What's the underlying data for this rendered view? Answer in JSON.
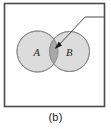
{
  "figure": {
    "caption": "(b)",
    "type": "venn-diagram",
    "panel_label": "(b)"
  },
  "frame": {
    "name": "outer-box",
    "x": 4.5,
    "y": 3.5,
    "width": 100,
    "height": 103,
    "stroke_color": "#4a4a4a",
    "stroke_width": 1.6,
    "fill_color": "#ffffff"
  },
  "sets": [
    {
      "label": "A",
      "cx": 37.5,
      "cy": 51.5,
      "r": 20.5,
      "fill_color": "#dcdcdc",
      "stroke_color": "#8c8c8c",
      "label_x": 33.5,
      "label_y": 55.5
    },
    {
      "label": "B",
      "cx": 69.5,
      "cy": 51.5,
      "r": 20.0,
      "fill_color": "#dcdcdc",
      "stroke_color": "#8c8c8c",
      "label_x": 66.0,
      "label_y": 55.5
    }
  ],
  "intersection": {
    "name": "intersection-lens",
    "fill_color": "#a8a8a8",
    "stroke_color": "#8c8c8c"
  },
  "callout": {
    "name": "callout-leader",
    "stroke_color": "#4a4a4a",
    "stroke_width": 1.0,
    "horizontal_start_x": 105,
    "horizontal_end_x": 85,
    "horizontal_y": 17,
    "arrow_tip_x": 55.5,
    "arrow_tip_y": 47.5,
    "arrow_color": "#141414"
  }
}
